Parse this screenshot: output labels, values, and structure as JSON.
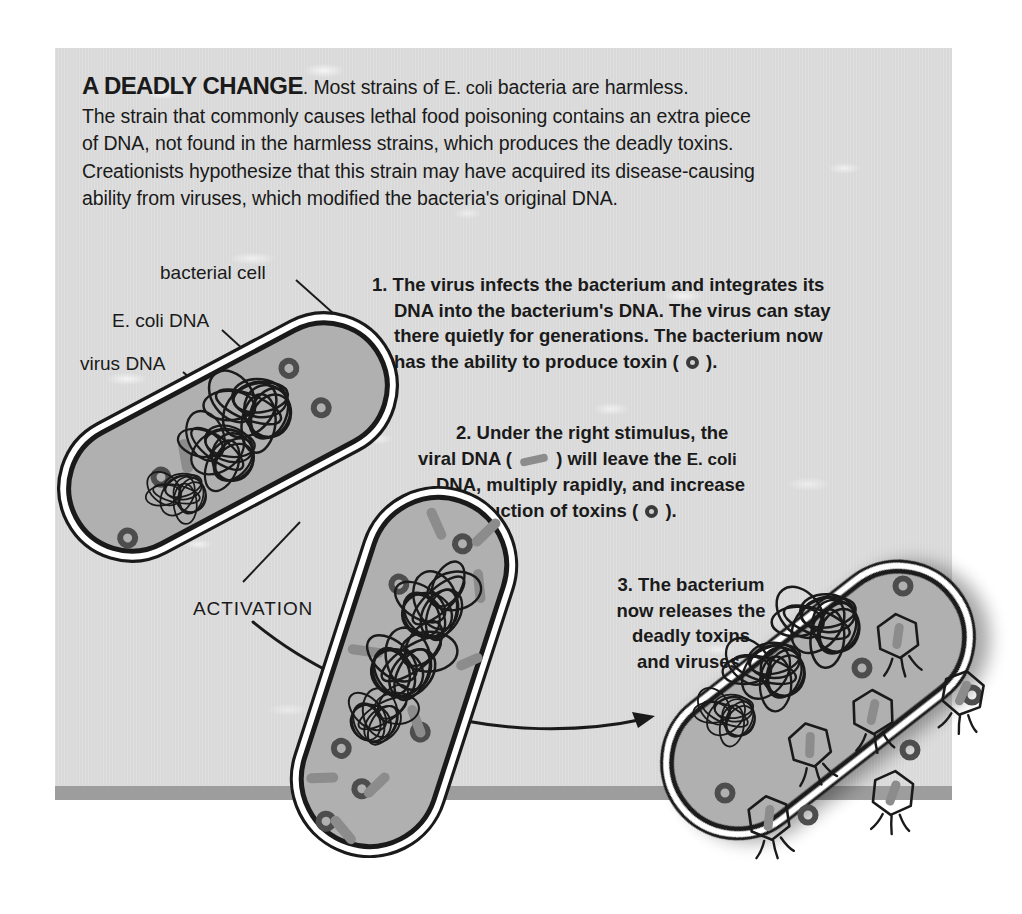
{
  "headline": {
    "title": "A DEADLY CHANGE",
    "title_suffix": ".",
    "lead_a": " Most strains of ",
    "lead_sci": "E. coli",
    "lead_b": " bacteria are harmless.",
    "body_line2": "The strain that commonly causes lethal food poisoning contains an extra piece",
    "body_line3": "of DNA, not found in the harmless strains, which produces the deadly toxins.",
    "body_line4": "Creationists hypothesize that this strain may have acquired its disease-causing",
    "body_line5": "ability from viruses, which modified the bacteria's original DNA."
  },
  "labels": {
    "bacterial_cell": "bacterial cell",
    "ecoli_dna": "E. coli DNA",
    "virus_dna": "virus DNA",
    "activation": "ACTIVATION"
  },
  "steps": [
    {
      "number": "1.",
      "lines": [
        "The virus infects the bacterium and integrates its",
        "DNA into the bacterium's DNA. The virus can stay",
        "there quietly for generations. The bacterium now"
      ],
      "final_prefix": "has the ability to produce toxin ( ",
      "final_suffix": " )."
    },
    {
      "number": "2.",
      "line1": "Under the right stimulus, the",
      "line2_a": "viral DNA ( ",
      "line2_b": " ) will leave the ",
      "line2_sci": "E. coli",
      "line3": "DNA, multiply rapidly, and increase",
      "line4_a": "production of toxins ( ",
      "line4_b": " )."
    },
    {
      "number": "3.",
      "lines": [
        "The bacterium",
        "now releases the",
        "deadly toxins",
        "and viruses."
      ]
    }
  ],
  "legend": {
    "toxin_symbol": "toxin-ring-icon",
    "viral_dna_symbol": "viral-dna-rod-icon",
    "virus_particle": "bacteriophage-icon",
    "dna_tangle": "dna-tangle-icon",
    "arrow": "arrow-icon"
  },
  "colors": {
    "panel_background": "#d9d9d9",
    "panel_bar": "#9d9d9d",
    "cell_fill": "#b3b3b3",
    "cell_membrane": "#ffffff",
    "outline": "#1a1a1a",
    "viral_dna": "#8c8c8c",
    "toxin_ring": "#4d4d4d",
    "text": "#1a1a1a",
    "page_background": "#ffffff"
  },
  "figure": {
    "caption_role": "scientific-process-diagram",
    "cell_count": 3,
    "cells": [
      {
        "name": "cell-stage-1",
        "stage": 1,
        "rotation_deg": -28,
        "toxins": 4,
        "free_viral_dna": 0,
        "released_viruses": 0
      },
      {
        "name": "cell-stage-2",
        "stage": 2,
        "rotation_deg": 18,
        "toxins": 6,
        "free_viral_dna": 12,
        "released_viruses": 0
      },
      {
        "name": "cell-stage-3",
        "stage": 3,
        "rotation_deg": -38,
        "toxins": 6,
        "free_viral_dna": 0,
        "released_viruses": 7
      }
    ]
  }
}
